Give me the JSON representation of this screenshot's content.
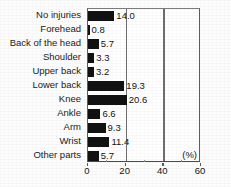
{
  "chart_data": {
    "type": "bar",
    "orientation": "horizontal",
    "title": "",
    "xlabel": "(%)",
    "ylabel": "",
    "xlim": [
      0,
      60
    ],
    "xticks": [
      0,
      20,
      40,
      60
    ],
    "xticklabels": [
      "0",
      "20",
      "40",
      "60"
    ],
    "grid": true,
    "legend": null,
    "categories": [
      "No injuries",
      "Forehead",
      "Back of the head",
      "Shoulder",
      "Upper back",
      "Lower back",
      "Knee",
      "Ankle",
      "Arm",
      "Wrist",
      "Other parts"
    ],
    "values": [
      14.0,
      0.8,
      5.7,
      3.3,
      3.2,
      19.3,
      20.6,
      6.6,
      9.3,
      11.4,
      5.7
    ],
    "value_labels": [
      "14.0",
      "0.8",
      "5.7",
      "3.3",
      "3.2",
      "19.3",
      "20.6",
      "6.6",
      "9.3",
      "11.4",
      "5.7"
    ],
    "bar_color": "#111111"
  },
  "axis": {
    "unit_label": "(%)"
  },
  "caption": {
    "text": ""
  }
}
